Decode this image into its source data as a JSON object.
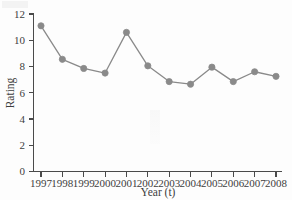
{
  "chart_data": {
    "type": "line",
    "title": "",
    "xlabel": "Year (t)",
    "ylabel": "Rating",
    "categories": [
      "1997",
      "1998",
      "1999",
      "2000",
      "2001",
      "2002",
      "2003",
      "2004",
      "2005",
      "2006",
      "2007",
      "2008"
    ],
    "x": [
      1997,
      1998,
      1999,
      2000,
      2001,
      2002,
      2003,
      2004,
      2005,
      2006,
      2007,
      2008
    ],
    "values": [
      11.1,
      8.55,
      7.85,
      7.5,
      10.6,
      8.05,
      6.85,
      6.65,
      7.95,
      6.85,
      7.6,
      7.25
    ],
    "series": [
      {
        "name": "Rating",
        "values": [
          11.1,
          8.55,
          7.85,
          7.5,
          10.6,
          8.05,
          6.85,
          6.65,
          7.95,
          6.85,
          7.6,
          7.25
        ]
      }
    ],
    "xlim": [
      1997,
      2008
    ],
    "ylim": [
      0,
      12
    ],
    "yticks": [
      0,
      2,
      4,
      6,
      8,
      10,
      12
    ],
    "ytick_labels": [
      "0",
      "2",
      "4",
      "6",
      "8",
      "10",
      "12"
    ],
    "xticks": [
      1997,
      1998,
      1999,
      2000,
      2001,
      2002,
      2003,
      2004,
      2005,
      2006,
      2007,
      2008
    ],
    "xtick_labels": [
      "1997",
      "1998",
      "1999",
      "2000",
      "2001",
      "2002",
      "2003",
      "2004",
      "2005",
      "2006",
      "2007",
      "2008"
    ],
    "grid": false,
    "legend": false,
    "legend_position": "none",
    "marker": "circle",
    "line_color": "#8a8a8a",
    "marker_color": "#8a8a8a",
    "axis_color": "#4a4a4a",
    "background_color": "#fdfdfd"
  }
}
